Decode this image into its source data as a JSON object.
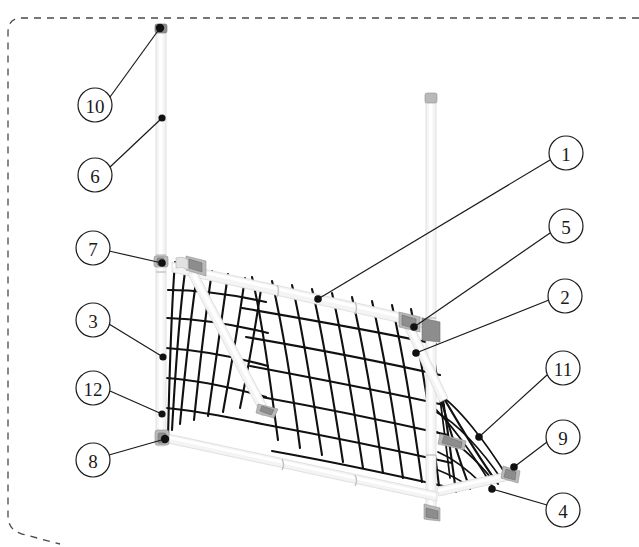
{
  "figure": {
    "type": "patent-line-drawing",
    "background_color": "#ffffff",
    "line_color": "#111111",
    "pipe_fill_color": "#f4f4f4",
    "joint_color": "#8d8d8d",
    "border": {
      "style": "dashed",
      "color": "#4a4a4a",
      "dash": "7 6",
      "corner_radius": 14
    }
  },
  "callouts": [
    {
      "id": "callout-10",
      "label": "10",
      "circle": {
        "cx": 95,
        "cy": 105,
        "r": 17
      },
      "leader": {
        "x1": 110,
        "y1": 97,
        "x2": 160,
        "y2": 28
      },
      "dot": {
        "cx": 160,
        "cy": 28,
        "r": 4.2
      },
      "target": "left-upright-top-cap"
    },
    {
      "id": "callout-6",
      "label": "6",
      "circle": {
        "cx": 95,
        "cy": 175,
        "r": 17
      },
      "leader": {
        "x1": 110,
        "y1": 167,
        "x2": 162,
        "y2": 118
      },
      "dot": {
        "cx": 162,
        "cy": 118,
        "r": 3.6
      },
      "target": "left-upright-extension-tube"
    },
    {
      "id": "callout-7",
      "label": "7",
      "circle": {
        "cx": 93,
        "cy": 248,
        "r": 17
      },
      "leader": {
        "x1": 109,
        "y1": 251,
        "x2": 162,
        "y2": 263
      },
      "dot": {
        "cx": 162,
        "cy": 263,
        "r": 3.8
      },
      "target": "left-top-corner-joint"
    },
    {
      "id": "callout-3",
      "label": "3",
      "circle": {
        "cx": 93,
        "cy": 320,
        "r": 17
      },
      "leader": {
        "x1": 109,
        "y1": 324,
        "x2": 163,
        "y2": 357
      },
      "dot": {
        "cx": 163,
        "cy": 357,
        "r": 3.6
      },
      "target": "left-goal-post-tube"
    },
    {
      "id": "callout-12",
      "label": "12",
      "circle": {
        "cx": 93,
        "cy": 388,
        "r": 17
      },
      "leader": {
        "x1": 110,
        "y1": 391,
        "x2": 162,
        "y2": 414
      },
      "dot": {
        "cx": 162,
        "cy": 414,
        "r": 3.6
      },
      "target": "left-post-lower-section"
    },
    {
      "id": "callout-8",
      "label": "8",
      "circle": {
        "cx": 93,
        "cy": 460,
        "r": 17
      },
      "leader": {
        "x1": 109,
        "y1": 455,
        "x2": 165,
        "y2": 439
      },
      "dot": {
        "cx": 165,
        "cy": 439,
        "r": 4.2
      },
      "target": "left-bottom-corner-joint"
    },
    {
      "id": "callout-1",
      "label": "1",
      "circle": {
        "cx": 566,
        "cy": 153,
        "r": 17
      },
      "leader": {
        "x1": 550,
        "y1": 160,
        "x2": 318,
        "y2": 299
      },
      "dot": {
        "cx": 318,
        "cy": 299,
        "r": 3.8
      },
      "target": "goal-crossbar"
    },
    {
      "id": "callout-5",
      "label": "5",
      "circle": {
        "cx": 566,
        "cy": 226,
        "r": 17
      },
      "leader": {
        "x1": 550,
        "y1": 233,
        "x2": 414,
        "y2": 327
      },
      "dot": {
        "cx": 414,
        "cy": 327,
        "r": 3.8
      },
      "target": "right-top-corner-joint"
    },
    {
      "id": "callout-2",
      "label": "2",
      "circle": {
        "cx": 565,
        "cy": 296,
        "r": 17
      },
      "leader": {
        "x1": 549,
        "y1": 300,
        "x2": 416,
        "y2": 353
      },
      "dot": {
        "cx": 416,
        "cy": 353,
        "r": 3.8
      },
      "target": "right-goal-post"
    },
    {
      "id": "callout-11",
      "label": "11",
      "circle": {
        "cx": 563,
        "cy": 368,
        "r": 17
      },
      "leader": {
        "x1": 547,
        "y1": 375,
        "x2": 479,
        "y2": 437
      },
      "dot": {
        "cx": 479,
        "cy": 437,
        "r": 3.8
      },
      "target": "rear-net-panel"
    },
    {
      "id": "callout-9",
      "label": "9",
      "circle": {
        "cx": 563,
        "cy": 437,
        "r": 17
      },
      "leader": {
        "x1": 547,
        "y1": 442,
        "x2": 514,
        "y2": 467
      },
      "dot": {
        "cx": 514,
        "cy": 467,
        "r": 3.8
      },
      "target": "rear-base-corner-joint"
    },
    {
      "id": "callout-4",
      "label": "4",
      "circle": {
        "cx": 563,
        "cy": 510,
        "r": 17
      },
      "leader": {
        "x1": 547,
        "y1": 505,
        "x2": 492,
        "y2": 489
      },
      "dot": {
        "cx": 492,
        "cy": 489,
        "r": 3.8
      },
      "target": "rear-ground-bar"
    }
  ],
  "structure": {
    "left_upright": {
      "top_x": 160,
      "top_y": 28,
      "bottom_x": 165,
      "bottom_y": 445
    },
    "right_upright": {
      "top_x": 431,
      "top_y": 95,
      "bottom_x": 435,
      "bottom_y": 520
    },
    "crossbar": {
      "left_x": 170,
      "left_y": 268,
      "right_x": 425,
      "right_y": 325
    },
    "front_ground_bar": {
      "left_x": 168,
      "left_y": 440,
      "right_x": 437,
      "right_y": 497
    },
    "goal_mouth_width_px": 258,
    "goal_mouth_height_px": 172,
    "net_mesh_columns": 13,
    "net_mesh_rows": 7
  }
}
